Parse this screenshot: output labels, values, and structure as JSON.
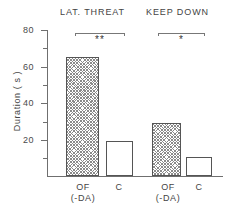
{
  "chart_data": {
    "type": "bar",
    "title": "",
    "xlabel": "",
    "ylabel": "Duration ( s )",
    "ylim": [
      0,
      80
    ],
    "yticks": [
      0,
      20,
      40,
      60,
      80
    ],
    "ytick_labels": [
      "",
      "20",
      "40",
      "60",
      "80"
    ],
    "yminor_ticks": [
      10,
      30,
      50,
      70
    ],
    "grid": false,
    "legend": "none",
    "groups": [
      {
        "label": "LAT. THREAT",
        "categories": [
          "OF",
          "C"
        ],
        "category_sublabels": [
          "(-DA)",
          ""
        ],
        "values": [
          65,
          19
        ],
        "fills": [
          "hatched",
          "open"
        ],
        "significance": "**"
      },
      {
        "label": "KEEP DOWN",
        "categories": [
          "OF",
          "C"
        ],
        "category_sublabels": [
          "(-DA)",
          ""
        ],
        "values": [
          29,
          10.5
        ],
        "fills": [
          "hatched",
          "open"
        ],
        "significance": "*"
      }
    ]
  },
  "axis": {
    "y_label": "Duration ( s )",
    "tick_80": "80",
    "tick_60": "60",
    "tick_40": "40",
    "tick_20": "20"
  },
  "groups": {
    "g0": {
      "title": "LAT. THREAT",
      "bar0_label": "OF",
      "bar0_sublabel": "(-DA)",
      "bar1_label": "C",
      "significance": "**"
    },
    "g1": {
      "title": "KEEP DOWN",
      "bar0_label": "OF",
      "bar0_sublabel": "(-DA)",
      "bar1_label": "C",
      "significance": "*"
    }
  }
}
